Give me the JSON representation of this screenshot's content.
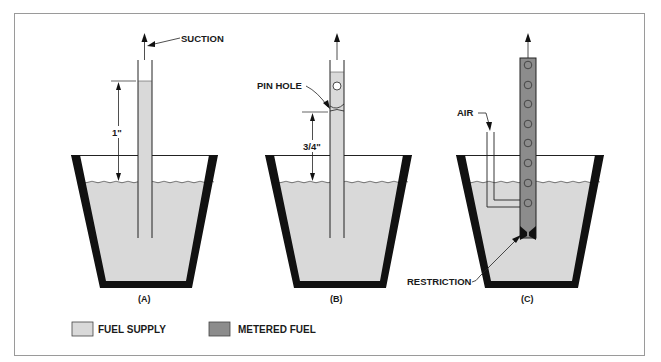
{
  "figure": {
    "panels": [
      {
        "id": "A",
        "label": "(A)",
        "annotations": [
          "SUCTION",
          "1\""
        ]
      },
      {
        "id": "B",
        "label": "(B)",
        "annotations": [
          "PIN HOLE",
          "3/4\""
        ]
      },
      {
        "id": "C",
        "label": "(C)",
        "annotations": [
          "AIR",
          "RESTRICTION"
        ]
      }
    ],
    "labels": {
      "suction": "SUCTION",
      "dim_a": "1\"",
      "pin_hole": "PIN HOLE",
      "dim_b": "3/4\"",
      "air": "AIR",
      "restriction": "RESTRICTION",
      "panel_a": "(A)",
      "panel_b": "(B)",
      "panel_c": "(C)"
    },
    "legend": [
      {
        "label": "FUEL SUPPLY",
        "color": "#d9d9d9"
      },
      {
        "label": "METERED FUEL",
        "color": "#8c8c8c"
      }
    ],
    "colors": {
      "fuel_supply": "#d9d9d9",
      "metered_fuel": "#8c8c8c",
      "container_wall": "#111111",
      "frame": "#9a9a9a",
      "line": "#222222"
    }
  }
}
